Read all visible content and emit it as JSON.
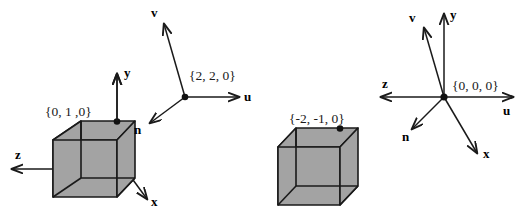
{
  "figure": {
    "title": "",
    "background_color": "#ffffff",
    "stroke_color": "#1a1a1a",
    "cube_fill_color": "#a3a3a3",
    "cube_edge_color": "#1a1a1a",
    "width": 526,
    "height": 221
  },
  "left_scene": {
    "name": "left-scene",
    "cube": {
      "name": "left-cube",
      "vertex_label": "{0, 1 ,0}",
      "vertex_marker": true,
      "fill": "#a3a3a3"
    },
    "world_axes": {
      "name": "left-world-axes",
      "origin_label": "",
      "axes": [
        {
          "key": "y",
          "label": "y",
          "direction": "up"
        },
        {
          "key": "z",
          "label": "z",
          "direction": "left"
        },
        {
          "key": "x",
          "label": "x",
          "direction": "down-right"
        }
      ]
    },
    "uvn_frame": {
      "name": "left-uvn-frame",
      "origin_label": "{2, 2, 0}",
      "axes": [
        {
          "key": "v",
          "label": "v",
          "direction": "up-left"
        },
        {
          "key": "u",
          "label": "u",
          "direction": "right"
        },
        {
          "key": "n",
          "label": "n",
          "direction": "down-left"
        }
      ]
    }
  },
  "right_scene": {
    "name": "right-scene",
    "cube": {
      "name": "right-cube",
      "vertex_label": "{-2, -1, 0}",
      "vertex_marker": true,
      "fill": "#a3a3a3"
    },
    "combined_frame": {
      "name": "right-combined-frame",
      "origin_label": "{0, 0, 0}",
      "axes": [
        {
          "key": "y",
          "label": "y",
          "direction": "up"
        },
        {
          "key": "v",
          "label": "v",
          "direction": "up-left"
        },
        {
          "key": "z",
          "label": "z",
          "direction": "left"
        },
        {
          "key": "u",
          "label": "u",
          "direction": "right"
        },
        {
          "key": "n",
          "label": "n",
          "direction": "down-left"
        },
        {
          "key": "x",
          "label": "x",
          "direction": "down-right"
        }
      ]
    }
  }
}
